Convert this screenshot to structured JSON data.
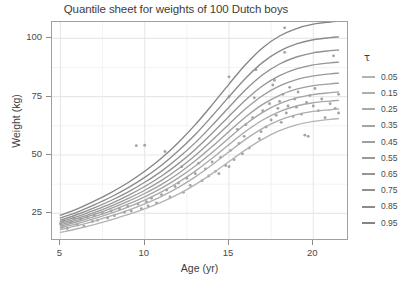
{
  "chart_data": {
    "type": "line",
    "title": "Quantile sheet for weights of 100 Dutch boys",
    "xlabel": "Age (yr)",
    "ylabel": "Weight (kg)",
    "xlim": [
      4.5,
      22.0
    ],
    "ylim": [
      14,
      107
    ],
    "xticks": [
      5,
      10,
      15,
      20
    ],
    "yticks": [
      25,
      50,
      75,
      100
    ],
    "grid": true,
    "legend_position": "right",
    "legend_title": "τ",
    "line_color": "#9a9a9a",
    "point_color": "#a3a3a3",
    "panel_background": "#ffffff",
    "grid_color": "#ebebeb",
    "series": [
      {
        "name": "0.05",
        "x": [
          5,
          6,
          7,
          8,
          9,
          10,
          11,
          12,
          13,
          14,
          15,
          16,
          17,
          18,
          19,
          20,
          21,
          21.5
        ],
        "values": [
          16.8,
          18.4,
          20.2,
          22.2,
          24.4,
          26.9,
          29.8,
          33.2,
          37.3,
          42.0,
          47.2,
          52.3,
          56.8,
          60.4,
          62.9,
          64.4,
          65.3,
          65.6
        ]
      },
      {
        "name": "0.15",
        "x": [
          5,
          6,
          7,
          8,
          9,
          10,
          11,
          12,
          13,
          14,
          15,
          16,
          17,
          18,
          19,
          20,
          21,
          21.5
        ],
        "values": [
          18.0,
          19.7,
          21.7,
          23.9,
          26.3,
          29.1,
          32.3,
          36.1,
          40.6,
          45.8,
          51.4,
          56.8,
          61.4,
          64.9,
          67.3,
          68.7,
          69.4,
          69.7
        ]
      },
      {
        "name": "0.25",
        "x": [
          5,
          6,
          7,
          8,
          9,
          10,
          11,
          12,
          13,
          14,
          15,
          16,
          17,
          18,
          19,
          20,
          21,
          21.5
        ],
        "values": [
          18.8,
          20.6,
          22.7,
          25.1,
          27.7,
          30.7,
          34.2,
          38.3,
          43.1,
          48.6,
          54.5,
          60.2,
          65.0,
          68.6,
          71.0,
          72.4,
          73.1,
          73.4
        ]
      },
      {
        "name": "0.35",
        "x": [
          5,
          6,
          7,
          8,
          9,
          10,
          11,
          12,
          13,
          14,
          15,
          16,
          17,
          18,
          19,
          20,
          21,
          21.5
        ],
        "values": [
          19.5,
          21.4,
          23.6,
          26.1,
          28.9,
          32.1,
          35.8,
          40.2,
          45.3,
          51.1,
          57.3,
          63.3,
          68.3,
          72.0,
          74.5,
          75.9,
          76.7,
          77.0
        ]
      },
      {
        "name": "0.45",
        "x": [
          5,
          6,
          7,
          8,
          9,
          10,
          11,
          12,
          13,
          14,
          15,
          16,
          17,
          18,
          19,
          20,
          21,
          21.5
        ],
        "values": [
          20.1,
          22.1,
          24.5,
          27.1,
          30.1,
          33.5,
          37.4,
          42.1,
          47.5,
          53.6,
          60.1,
          66.4,
          71.7,
          75.6,
          78.2,
          79.7,
          80.5,
          80.8
        ]
      },
      {
        "name": "0.55",
        "x": [
          5,
          6,
          7,
          8,
          9,
          10,
          11,
          12,
          13,
          14,
          15,
          16,
          17,
          18,
          19,
          20,
          21,
          21.5
        ],
        "values": [
          20.7,
          22.8,
          25.3,
          28.1,
          31.3,
          34.9,
          39.1,
          44.1,
          49.8,
          56.3,
          63.2,
          69.9,
          75.5,
          79.6,
          82.3,
          83.9,
          84.8,
          85.1
        ]
      },
      {
        "name": "0.65",
        "x": [
          5,
          6,
          7,
          8,
          9,
          10,
          11,
          12,
          13,
          14,
          15,
          16,
          17,
          18,
          19,
          20,
          21,
          21.5
        ],
        "values": [
          21.4,
          23.6,
          26.3,
          29.2,
          32.6,
          36.5,
          41.0,
          46.3,
          52.4,
          59.3,
          66.6,
          73.7,
          79.7,
          84.0,
          86.9,
          88.6,
          89.5,
          89.8
        ]
      },
      {
        "name": "0.75",
        "x": [
          5,
          6,
          7,
          8,
          9,
          10,
          11,
          12,
          13,
          14,
          15,
          16,
          17,
          18,
          19,
          20,
          21,
          21.5
        ],
        "values": [
          22.1,
          24.5,
          27.3,
          30.5,
          34.1,
          38.3,
          43.1,
          48.8,
          55.3,
          62.7,
          70.5,
          78.1,
          84.4,
          89.0,
          92.0,
          93.8,
          94.7,
          95.0
        ]
      },
      {
        "name": "0.85",
        "x": [
          5,
          6,
          7,
          8,
          9,
          10,
          11,
          12,
          13,
          14,
          15,
          16,
          17,
          18,
          19,
          20,
          21,
          21.5
        ],
        "values": [
          23.0,
          25.5,
          28.6,
          32.0,
          35.9,
          40.4,
          45.6,
          51.8,
          58.8,
          66.7,
          75.0,
          83.0,
          89.7,
          94.5,
          97.6,
          99.4,
          100.3,
          100.6
        ]
      },
      {
        "name": "0.95",
        "x": [
          5,
          6,
          7,
          8,
          9,
          10,
          11,
          12,
          13,
          14,
          15,
          16,
          17,
          18,
          19,
          20,
          21,
          21.5
        ],
        "values": [
          24.2,
          26.9,
          30.2,
          33.9,
          38.1,
          43.0,
          48.7,
          55.4,
          63.0,
          71.5,
          80.4,
          88.9,
          96.0,
          101.0,
          104.2,
          106.1,
          107.0,
          107.3
        ]
      }
    ],
    "scatter": {
      "name": "weights of 100 Dutch boys",
      "points": [
        [
          5.0,
          20.5
        ],
        [
          5.1,
          19.0
        ],
        [
          5.2,
          22.0
        ],
        [
          5.4,
          18.5
        ],
        [
          5.6,
          21.0
        ],
        [
          5.8,
          23.0
        ],
        [
          6.0,
          20.0
        ],
        [
          6.2,
          22.5
        ],
        [
          6.4,
          19.5
        ],
        [
          6.6,
          23.5
        ],
        [
          6.9,
          21.5
        ],
        [
          7.0,
          24.0
        ],
        [
          7.2,
          22.0
        ],
        [
          7.5,
          25.0
        ],
        [
          7.8,
          23.0
        ],
        [
          8.0,
          26.0
        ],
        [
          8.2,
          24.0
        ],
        [
          8.5,
          27.0
        ],
        [
          8.8,
          25.5
        ],
        [
          9.0,
          28.0
        ],
        [
          9.2,
          26.0
        ],
        [
          9.5,
          54.0
        ],
        [
          9.6,
          29.0
        ],
        [
          9.8,
          27.0
        ],
        [
          10.0,
          54.2
        ],
        [
          10.1,
          30.0
        ],
        [
          10.2,
          28.2
        ],
        [
          10.4,
          31.5
        ],
        [
          10.7,
          29.5
        ],
        [
          11.0,
          33.0
        ],
        [
          11.2,
          51.5
        ],
        [
          11.3,
          35.0
        ],
        [
          11.5,
          32.0
        ],
        [
          11.8,
          36.5
        ],
        [
          12.0,
          38.0
        ],
        [
          12.2,
          45.0
        ],
        [
          12.3,
          34.0
        ],
        [
          12.5,
          40.0
        ],
        [
          12.7,
          37.0
        ],
        [
          13.0,
          42.0
        ],
        [
          13.2,
          46.5
        ],
        [
          13.4,
          39.0
        ],
        [
          13.6,
          44.0
        ],
        [
          13.8,
          41.0
        ],
        [
          14.0,
          47.0
        ],
        [
          14.2,
          43.0
        ],
        [
          14.4,
          42.0
        ],
        [
          14.5,
          49.0
        ],
        [
          14.8,
          45.5
        ],
        [
          15.0,
          83.5
        ],
        [
          15.0,
          75.0
        ],
        [
          15.0,
          45.0
        ],
        [
          15.1,
          52.0
        ],
        [
          15.3,
          48.0
        ],
        [
          15.5,
          61.0
        ],
        [
          15.6,
          55.0
        ],
        [
          15.8,
          50.5
        ],
        [
          15.9,
          58.0
        ],
        [
          16.0,
          63.0
        ],
        [
          16.2,
          53.0
        ],
        [
          16.4,
          66.0
        ],
        [
          16.5,
          74.5
        ],
        [
          16.6,
          86.5
        ],
        [
          16.8,
          57.0
        ],
        [
          16.9,
          60.0
        ],
        [
          17.0,
          69.0
        ],
        [
          17.2,
          62.0
        ],
        [
          17.4,
          72.0
        ],
        [
          17.5,
          65.0
        ],
        [
          17.6,
          80.0
        ],
        [
          17.7,
          82.0
        ],
        [
          17.8,
          67.0
        ],
        [
          17.9,
          70.0
        ],
        [
          18.0,
          73.0
        ],
        [
          18.1,
          64.0
        ],
        [
          18.2,
          76.0
        ],
        [
          18.3,
          104.5
        ],
        [
          18.3,
          94.0
        ],
        [
          18.4,
          68.0
        ],
        [
          18.5,
          71.0
        ],
        [
          18.6,
          79.0
        ],
        [
          18.8,
          66.5
        ],
        [
          18.9,
          74.0
        ],
        [
          19.0,
          70.5
        ],
        [
          19.1,
          77.0
        ],
        [
          19.3,
          67.5
        ],
        [
          19.5,
          58.5
        ],
        [
          19.6,
          72.5
        ],
        [
          19.7,
          58.0
        ],
        [
          19.8,
          75.5
        ],
        [
          20.0,
          71.0
        ],
        [
          20.1,
          78.5
        ],
        [
          20.3,
          69.0
        ],
        [
          20.5,
          74.0
        ],
        [
          20.7,
          66.0
        ],
        [
          21.0,
          72.0
        ],
        [
          21.2,
          92.5
        ],
        [
          21.3,
          70.0
        ],
        [
          21.5,
          76.0
        ],
        [
          21.5,
          68.0
        ]
      ]
    }
  },
  "legend": {
    "title": "τ",
    "items": [
      {
        "label": "0.05",
        "color": "#b3b3b3"
      },
      {
        "label": "0.15",
        "color": "#aeaeae"
      },
      {
        "label": "0.25",
        "color": "#a9a9a9"
      },
      {
        "label": "0.35",
        "color": "#a4a4a4"
      },
      {
        "label": "0.45",
        "color": "#9f9f9f"
      },
      {
        "label": "0.55",
        "color": "#9a9a9a"
      },
      {
        "label": "0.65",
        "color": "#959595"
      },
      {
        "label": "0.75",
        "color": "#909090"
      },
      {
        "label": "0.85",
        "color": "#8b8b8b"
      },
      {
        "label": "0.95",
        "color": "#858585"
      }
    ]
  }
}
